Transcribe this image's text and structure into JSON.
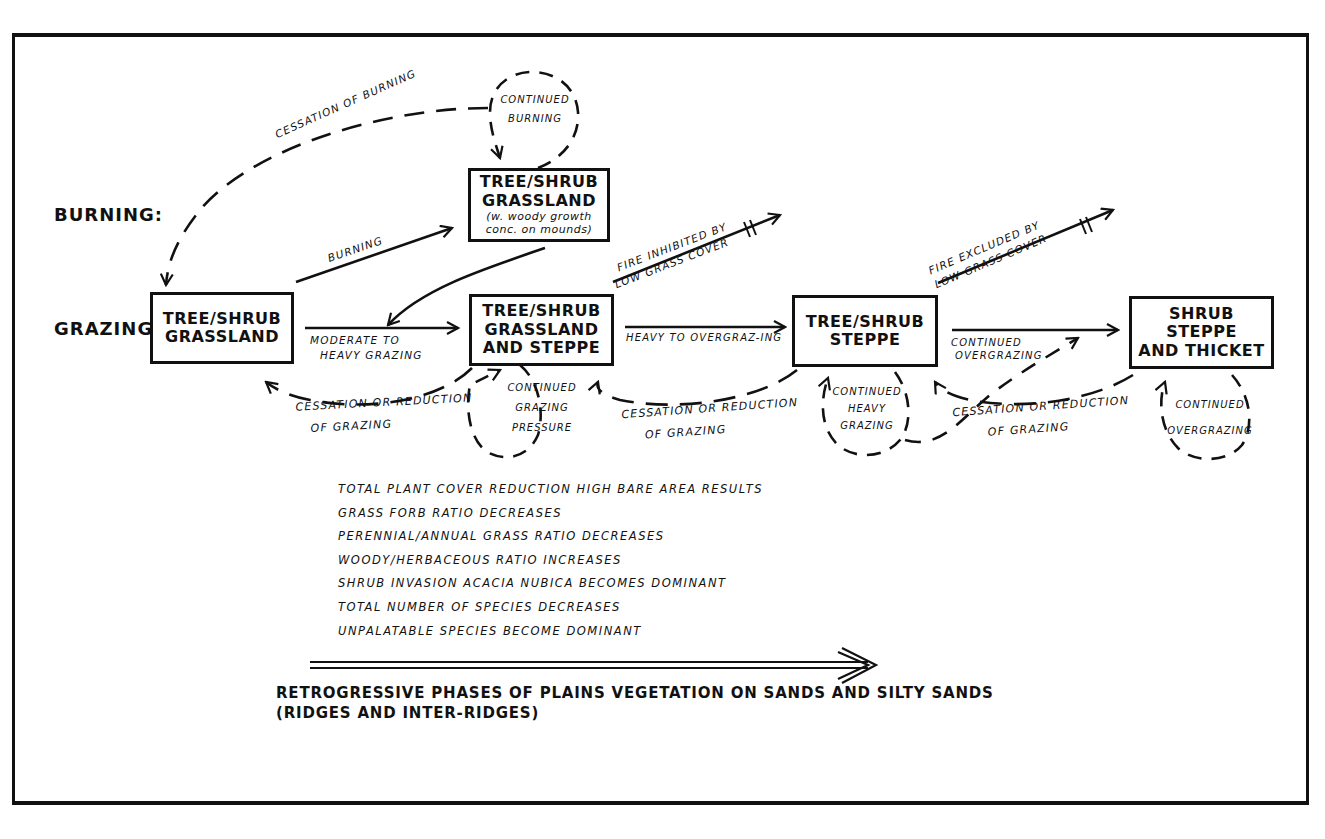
{
  "figure": {
    "row_labels": {
      "burning": "BURNING:",
      "grazing": "GRAZING:"
    },
    "states": [
      {
        "id": "tsg",
        "title_lines": [
          "TREE/SHRUB",
          "GRASSLAND"
        ]
      },
      {
        "id": "tsg_burn",
        "title_lines": [
          "TREE/SHRUB",
          "GRASSLAND"
        ],
        "note_lines": [
          "(w. woody growth",
          "conc. on mounds)"
        ]
      },
      {
        "id": "tsgs",
        "title_lines": [
          "TREE/SHRUB",
          "GRASSLAND",
          "AND STEPPE"
        ]
      },
      {
        "id": "tss",
        "title_lines": [
          "TREE/SHRUB",
          "STEPPE"
        ]
      },
      {
        "id": "sst",
        "title_lines": [
          "SHRUB STEPPE",
          "AND THICKET"
        ]
      }
    ],
    "transitions": {
      "cessation_of_burning": "CESSATION OF BURNING",
      "continued_burning": [
        "CONTINUED",
        "BURNING"
      ],
      "burning": "BURNING",
      "moderate_to_heavy": [
        "MODERATE TO",
        "HEAVY GRAZING"
      ],
      "fire_inhibited": [
        "FIRE INHIBITED BY",
        "LOW GRASS COVER"
      ],
      "heavy_to_overgrazing": "HEAVY TO OVERGRAZ-ING",
      "fire_excluded": [
        "FIRE EXCLUDED BY",
        "LOW GRASS COVER"
      ],
      "continued_overgrazing_arrow": [
        "CONTINUED",
        "OVERGRAZING"
      ],
      "cessation_reduction_1": [
        "CESSATION OR REDUCTION",
        "OF GRAZING"
      ],
      "cessation_reduction_2": [
        "CESSATION OR REDUCTION",
        "OF GRAZING"
      ],
      "cessation_reduction_3": [
        "CESSATION OR REDUCTION",
        "OF GRAZING"
      ],
      "continued_grazing_pressure": [
        "CONTINUED",
        "GRAZING",
        "PRESSURE"
      ],
      "continued_heavy_grazing": [
        "CONTINUED",
        "HEAVY",
        "GRAZING"
      ],
      "continued_overgrazing_loop": [
        "CONTINUED",
        "OVERGRAZING"
      ]
    },
    "effects": [
      "TOTAL PLANT COVER REDUCTION HIGH BARE AREA RESULTS",
      "GRASS FORB RATIO DECREASES",
      "PERENNIAL/ANNUAL GRASS RATIO DECREASES",
      "WOODY/HERBACEOUS RATIO INCREASES",
      "SHRUB INVASION ACACIA NUBICA BECOMES DOMINANT",
      "TOTAL NUMBER OF SPECIES DECREASES",
      "UNPALATABLE SPECIES BECOME DOMINANT"
    ],
    "caption_lines": [
      "RETROGRESSIVE PHASES OF PLAINS VEGETATION ON SANDS AND SILTY SANDS",
      "(RIDGES AND INTER-RIDGES)"
    ]
  }
}
